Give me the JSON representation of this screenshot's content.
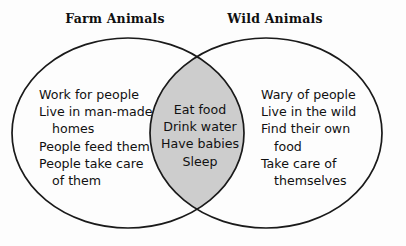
{
  "diagram": {
    "kind": "venn-diagram",
    "background_color": "#fdfdfd",
    "outline_color": "#1a1a1a",
    "intersection_fill_color": "#cdcdcd",
    "text_color": "#111111"
  },
  "left_circle": {
    "title": "Farm Animals",
    "lines": [
      {
        "text": "Work for people",
        "indent": false
      },
      {
        "text": "Live in man-made",
        "indent": false
      },
      {
        "text": "homes",
        "indent": true
      },
      {
        "text": "People feed them",
        "indent": false
      },
      {
        "text": "People take care",
        "indent": false
      },
      {
        "text": "of them",
        "indent": true
      }
    ]
  },
  "right_circle": {
    "title": "Wild Animals",
    "lines": [
      {
        "text": "Wary of people",
        "indent": false
      },
      {
        "text": "Live in the wild",
        "indent": false
      },
      {
        "text": "Find their own",
        "indent": false
      },
      {
        "text": "food",
        "indent": true
      },
      {
        "text": "Take care of",
        "indent": false
      },
      {
        "text": "themselves",
        "indent": true
      }
    ]
  },
  "intersection": {
    "lines": [
      {
        "text": "Eat food",
        "indent": false
      },
      {
        "text": "Drink water",
        "indent": false
      },
      {
        "text": "Have babies",
        "indent": false
      },
      {
        "text": "Sleep",
        "indent": false
      }
    ]
  }
}
